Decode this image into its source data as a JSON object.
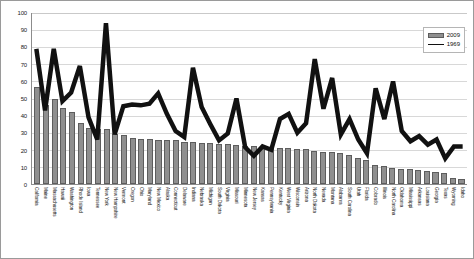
{
  "legend": {
    "position": "top-right",
    "entries": [
      {
        "label": "2009",
        "type": "bar",
        "color": "#8f8f8f"
      },
      {
        "label": "1969",
        "type": "line",
        "color": "#111111"
      }
    ]
  },
  "axis": {
    "y_ticks": [
      "0",
      "10",
      "20",
      "30",
      "40",
      "50",
      "60",
      "70",
      "80",
      "90",
      "100"
    ]
  },
  "chart_data": {
    "type": "bar",
    "title": "",
    "subtitle": "",
    "xlabel": "",
    "ylabel": "",
    "ylim": [
      0,
      100
    ],
    "grid": true,
    "legend_position": "top-right",
    "categories": [
      "California",
      "Maine",
      "Massachusetts",
      "Hawaii",
      "Washington",
      "Rhode Island",
      "Iowa",
      "Tennessee",
      "New York",
      "New Hampshire",
      "Vermont",
      "Oregon",
      "Ohio",
      "Maryland",
      "New Mexico",
      "Alaska",
      "Connecticut",
      "Delaware",
      "Indiana",
      "Nebraska",
      "Michigan",
      "South Dakota",
      "Virginia",
      "Missouri",
      "Minnesota",
      "New Jersey",
      "Kansas",
      "Pennsylvania",
      "Kentucky",
      "West Virginia",
      "Wisconsin",
      "Arizona",
      "North Dakota",
      "Nevada",
      "Montana",
      "Alabama",
      "South Carolina",
      "Utah",
      "Florida",
      "Colorado",
      "Illinois",
      "North Carolina",
      "Oklahoma",
      "Mississippi",
      "Arkansas",
      "Louisiana",
      "Georgia",
      "Texas",
      "Wyoming",
      "Idaho"
    ],
    "series": [
      {
        "name": "2009",
        "type": "bar",
        "color": "#8f8f8f",
        "values": [
          57,
          46,
          49.5,
          44.5,
          42,
          35.5,
          32.5,
          32,
          32,
          29,
          28.5,
          27,
          26.5,
          26.5,
          26,
          26,
          25.5,
          24.5,
          24.5,
          24,
          24,
          23.5,
          23.5,
          23,
          22.5,
          22,
          21.5,
          21,
          21,
          21,
          20.5,
          20.5,
          19.5,
          19,
          18.5,
          18,
          17,
          15.5,
          14,
          11,
          10.5,
          9.5,
          9,
          8.5,
          8,
          7.5,
          7,
          6.5,
          3.5,
          3
        ]
      },
      {
        "name": "1969",
        "type": "line",
        "color": "#111111",
        "values": [
          79,
          43,
          79,
          48.5,
          53.5,
          69,
          39,
          26,
          94,
          29,
          45.5,
          46.5,
          46,
          47,
          53,
          41,
          31,
          27.5,
          68,
          45,
          35,
          25.5,
          29.5,
          50,
          21.5,
          16.5,
          22,
          20,
          38,
          41,
          30,
          35.5,
          73,
          44,
          62,
          29,
          38,
          26,
          18,
          56,
          38,
          60,
          31,
          25,
          28,
          23,
          26,
          15,
          22,
          22
        ]
      }
    ]
  }
}
